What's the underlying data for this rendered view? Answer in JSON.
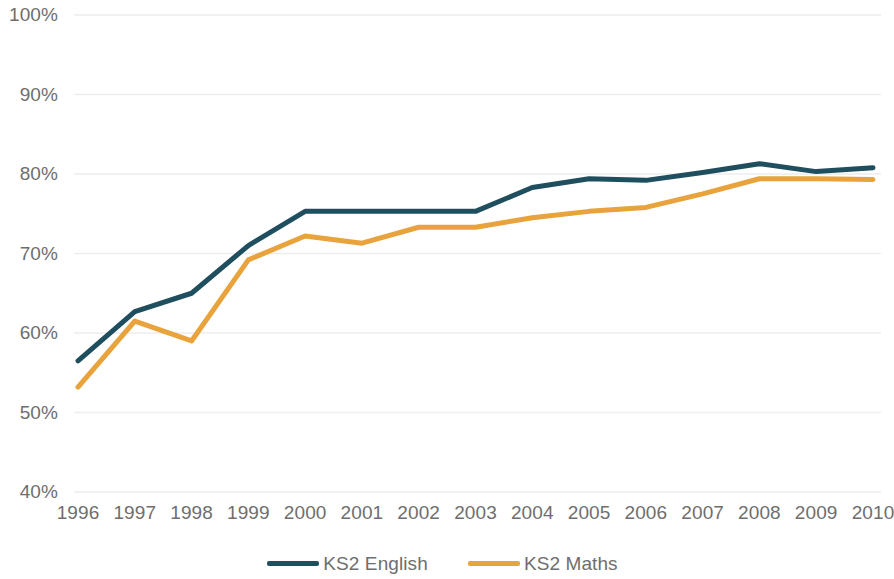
{
  "chart_data": {
    "type": "line",
    "title": "",
    "subtitle": "",
    "xlabel": "",
    "ylabel": "",
    "x": [
      1996,
      1997,
      1998,
      1999,
      2000,
      2001,
      2002,
      2003,
      2004,
      2005,
      2006,
      2007,
      2008,
      2009,
      2010
    ],
    "categories": [
      "1996",
      "1997",
      "1998",
      "1999",
      "2000",
      "2001",
      "2002",
      "2003",
      "2004",
      "2005",
      "2006",
      "2007",
      "2008",
      "2009",
      "2010"
    ],
    "series": [
      {
        "name": "KS2 English",
        "color": "#1F4E5E",
        "values": [
          56.5,
          62.7,
          65.0,
          71.0,
          75.3,
          75.3,
          75.3,
          75.3,
          78.3,
          79.4,
          79.2,
          80.2,
          81.3,
          80.3,
          80.8
        ]
      },
      {
        "name": "KS2 Maths",
        "color": "#E8A33D",
        "values": [
          53.2,
          61.5,
          59.0,
          69.2,
          72.2,
          71.3,
          73.3,
          73.3,
          74.5,
          75.3,
          75.8,
          77.5,
          79.4,
          79.4,
          79.3
        ]
      }
    ],
    "ylim": [
      40,
      100
    ],
    "yticks": [
      100,
      90,
      80,
      70,
      60,
      50,
      40
    ],
    "ytick_labels": [
      "100%",
      "90%",
      "80%",
      "70%",
      "60%",
      "50%",
      "40%"
    ],
    "ytick_suffix": "%",
    "grid": true,
    "grid_axis": "y",
    "grid_color": "#EDEDED",
    "legend_position": "bottom",
    "background_color": "#FFFFFF",
    "axis_label_color": "#6E6E6E",
    "line_width": 5
  },
  "legend": {
    "items": [
      {
        "label": "KS2 English",
        "color": "#1F4E5E",
        "swatch": "line-swatch"
      },
      {
        "label": "KS2 Maths",
        "color": "#E8A33D",
        "swatch": "line-swatch"
      }
    ]
  }
}
